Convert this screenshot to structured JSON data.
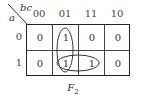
{
  "kmap": {
    "row_variable": "a",
    "col_variable": "bc",
    "col_headers": [
      "00",
      "01",
      "11",
      "10"
    ],
    "row_headers": [
      "0",
      "1"
    ],
    "cells": [
      [
        "0",
        "1",
        "0",
        "0"
      ],
      [
        "0",
        "1",
        "1",
        "0"
      ]
    ],
    "groups": [
      {
        "cells": [
          [
            0,
            1
          ],
          [
            1,
            1
          ]
        ],
        "orientation": "vertical"
      },
      {
        "cells": [
          [
            1,
            1
          ],
          [
            1,
            2
          ]
        ],
        "orientation": "horizontal"
      }
    ],
    "function_label": "F",
    "function_subscript": "2"
  }
}
